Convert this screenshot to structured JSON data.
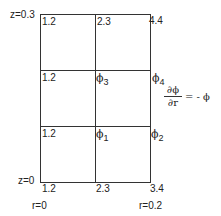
{
  "diagram": {
    "type": "finite-difference grid",
    "z_labels": {
      "top": "z=0.3",
      "bottom": "z=0"
    },
    "r_labels": {
      "left": "r=0",
      "right": "r=0.2"
    },
    "top_row_values": [
      "1.2",
      "2.3",
      "4.4"
    ],
    "bottom_row_values": [
      "1.2",
      "2.3",
      "3.4"
    ],
    "left_column_values": {
      "row1": "1.2",
      "row2": "1.2"
    },
    "unknowns": {
      "phi3": {
        "symbol": "ϕ",
        "sub": "3"
      },
      "phi4": {
        "symbol": "ϕ",
        "sub": "4"
      },
      "phi1": {
        "symbol": "ϕ",
        "sub": "1"
      },
      "phi2": {
        "symbol": "ϕ",
        "sub": "2"
      }
    },
    "boundary_condition": {
      "numerator": "∂ϕ",
      "denominator": "∂r",
      "rhs": "= - ϕ"
    }
  }
}
